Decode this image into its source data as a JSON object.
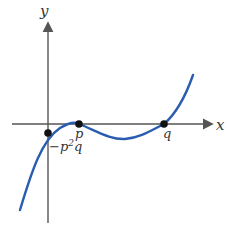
{
  "diagram": {
    "type": "cubic-graph",
    "axes": {
      "x_label": "x",
      "y_label": "y"
    },
    "points": [
      {
        "label": "-p²q",
        "label_main": "−p",
        "label_sup": "2",
        "label_tail": "q"
      },
      {
        "label": "p"
      },
      {
        "label": "q"
      }
    ],
    "colors": {
      "curve": "#2a5db0",
      "axis": "#555555",
      "point": "#111111"
    }
  }
}
